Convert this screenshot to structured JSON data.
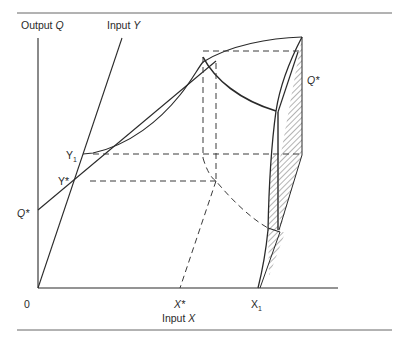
{
  "figure": {
    "axis_labels": {
      "vertical_prefix": "Output",
      "vertical_var": "Q",
      "ray_prefix": "Input",
      "ray_var": "Y",
      "horizontal_prefix": "Input",
      "horizontal_var": "X"
    },
    "tick_labels": {
      "origin": "0",
      "q_star_left": "Q*",
      "q_star_right": "Q*",
      "y1": "Y",
      "y1_sub": "1",
      "y_star": "Y*",
      "x_star": "X*",
      "x1": "X",
      "x1_sub": "1"
    },
    "colors": {
      "ink": "#2a2a2a",
      "rule": "#555555",
      "background": "#ffffff"
    }
  }
}
